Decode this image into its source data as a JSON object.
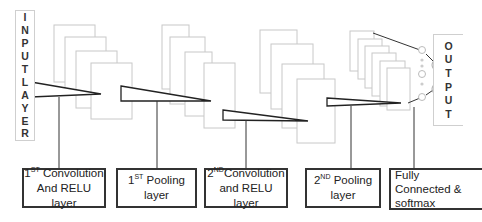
{
  "diagram": {
    "input_layer": {
      "letters": [
        "I",
        "N",
        "P",
        "U",
        "T",
        "L",
        "A",
        "Y",
        "E",
        "R"
      ]
    },
    "output_layer": {
      "letters": [
        "O",
        "U",
        "T",
        "P",
        "U",
        "T"
      ]
    },
    "stages": [
      {
        "id": "conv1",
        "prefix": "1",
        "sup": "ST",
        "line1_rest": " Convolution",
        "line2": "And RELU layer"
      },
      {
        "id": "pool1",
        "prefix": "1",
        "sup": "ST",
        "line1_rest": " Pooling",
        "line2": "layer"
      },
      {
        "id": "conv2",
        "prefix": "2",
        "sup": "ND",
        "line1_rest": "Convolution",
        "line2": "and RELU layer"
      },
      {
        "id": "pool2",
        "prefix": "2",
        "sup": "ND",
        "line1_rest": " Pooling",
        "line2": "layer"
      },
      {
        "id": "fc",
        "line1": "Fully",
        "line2": "Connected &",
        "line3": "softmax"
      }
    ],
    "colors": {
      "feature_map_stroke": "#c8c8c8",
      "line": "#222222",
      "box_border": "#333333"
    }
  }
}
